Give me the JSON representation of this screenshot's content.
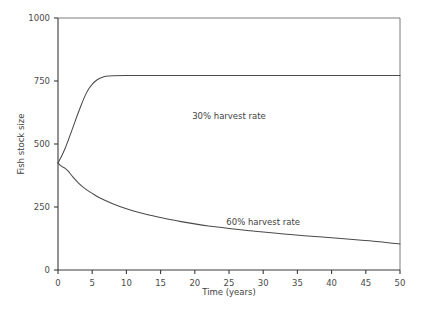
{
  "chart_data": {
    "type": "line",
    "title": "",
    "xlabel": "Time (years)",
    "ylabel": "Fish stock size",
    "xlim": [
      0,
      50
    ],
    "ylim": [
      0,
      1000
    ],
    "xticks": [
      0,
      5,
      10,
      15,
      20,
      25,
      30,
      35,
      40,
      45,
      50
    ],
    "xticklabels": [
      "0",
      "5",
      "10",
      "15",
      "20",
      "25",
      "30",
      "35",
      "40",
      "45",
      "50"
    ],
    "yticks": [
      0,
      250,
      500,
      750,
      1000
    ],
    "yticklabels": [
      "0",
      "250",
      "500",
      "750",
      "1000"
    ],
    "grid": false,
    "legend": "inline-annotations",
    "line_color": "#4a4a4a",
    "axis_color": "#3a3a3a",
    "background": "#ffffff",
    "series": [
      {
        "name": "30% harvest rate",
        "annotation": "30% harvest rate",
        "annotation_x": 25,
        "annotation_y": 600,
        "x": [
          0,
          0.5,
          1,
          1.5,
          2,
          2.5,
          3,
          3.5,
          4,
          4.5,
          5,
          5.5,
          6,
          6.5,
          7,
          8,
          10,
          15,
          20,
          25,
          30,
          35,
          40,
          45,
          50
        ],
        "values": [
          425,
          450,
          480,
          515,
          552,
          590,
          627,
          662,
          694,
          719,
          737,
          750,
          759,
          765,
          769,
          771,
          772,
          772,
          772,
          772,
          772,
          772,
          772,
          772,
          772
        ]
      },
      {
        "name": "60% harvest rate",
        "annotation": "60% harvest rate",
        "annotation_x": 30,
        "annotation_y": 180,
        "x": [
          0,
          0.5,
          1,
          1.5,
          2,
          3,
          4,
          5,
          6,
          8,
          10,
          12,
          14,
          16,
          18,
          20,
          22,
          25,
          28,
          30,
          33,
          36,
          40,
          44,
          47,
          50
        ],
        "values": [
          425,
          412,
          404,
          392,
          375,
          345,
          322,
          304,
          288,
          263,
          243,
          227,
          214,
          202,
          192,
          183,
          175,
          165,
          156,
          151,
          143,
          136,
          128,
          119,
          112,
          103
        ]
      }
    ]
  },
  "figure": {
    "ylabel_text": "Fish stock size",
    "xlabel_text": "Time (years)"
  }
}
